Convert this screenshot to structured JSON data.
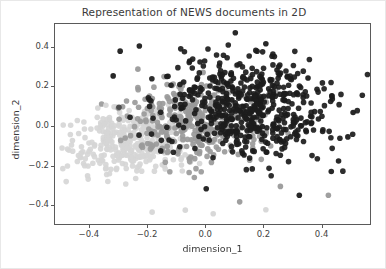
{
  "figure": {
    "width": 386,
    "height": 269,
    "background": "#ffffff",
    "frame_color": "#5a5a5a"
  },
  "chart_data": {
    "type": "scatter",
    "title": "Representation of NEWS documents in 2D",
    "xlabel": "dimension_1",
    "ylabel": "dimension_2",
    "xlim": [
      -0.52,
      0.57
    ],
    "ylim": [
      -0.5,
      0.52
    ],
    "xticks": [
      -0.4,
      -0.2,
      0.0,
      0.2,
      0.4
    ],
    "xticklabels": [
      "−0.4",
      "−0.2",
      "0.0",
      "0.2",
      "0.4"
    ],
    "yticks": [
      -0.4,
      -0.2,
      0.0,
      0.2,
      0.4
    ],
    "yticklabels": [
      "−0.4",
      "−0.2",
      "0.0",
      "0.2",
      "0.4"
    ],
    "grid": false,
    "legend": null,
    "marker": "circle",
    "marker_size_px": 5.6,
    "marker_alpha": 0.92,
    "series": [
      {
        "name": "cluster-light",
        "color": "#d6d6d6",
        "count": 360,
        "center": [
          -0.245,
          -0.072
        ],
        "spread": [
          0.115,
          0.082
        ],
        "rotation_deg": 14,
        "seed": 1377
      },
      {
        "name": "cluster-medium",
        "color": "#9a9a9a",
        "count": 330,
        "center": [
          -0.035,
          0.018
        ],
        "spread": [
          0.125,
          0.11
        ],
        "rotation_deg": 26,
        "seed": 4211
      },
      {
        "name": "cluster-dark",
        "color": "#1c1c1c",
        "count": 520,
        "center": [
          0.145,
          0.095
        ],
        "spread": [
          0.15,
          0.128
        ],
        "rotation_deg": -12,
        "seed": 8093
      }
    ],
    "outliers": [
      {
        "x": -0.296,
        "y": 0.383,
        "color": "#1c1c1c"
      },
      {
        "x": -0.23,
        "y": 0.409,
        "color": "#1c1c1c"
      },
      {
        "x": -0.32,
        "y": 0.258,
        "color": "#1c1c1c"
      },
      {
        "x": -0.3,
        "y": 0.1,
        "color": "#4a4a4a"
      },
      {
        "x": 0.1,
        "y": 0.476,
        "color": "#1c1c1c"
      },
      {
        "x": 0.205,
        "y": 0.42,
        "color": "#1c1c1c"
      },
      {
        "x": 0.35,
        "y": 0.247,
        "color": "#1c1c1c"
      },
      {
        "x": 0.432,
        "y": 0.158,
        "color": "#1c1c1c"
      },
      {
        "x": 0.505,
        "y": 0.073,
        "color": "#1c1c1c"
      },
      {
        "x": 0.487,
        "y": -0.05,
        "color": "#1c1c1c"
      },
      {
        "x": 0.455,
        "y": -0.172,
        "color": "#1c1c1c"
      },
      {
        "x": 0.43,
        "y": -0.225,
        "color": "#1c1c1c"
      },
      {
        "x": 0.42,
        "y": -0.345,
        "color": "#9a9a9a"
      },
      {
        "x": 0.32,
        "y": -0.345,
        "color": "#1c1c1c"
      },
      {
        "x": 0.0,
        "y": -0.312,
        "color": "#1c1c1c"
      },
      {
        "x": -0.46,
        "y": -0.068,
        "color": "#d6d6d6"
      },
      {
        "x": -0.43,
        "y": -0.132,
        "color": "#d6d6d6"
      },
      {
        "x": -0.408,
        "y": -0.246,
        "color": "#d6d6d6"
      },
      {
        "x": -0.186,
        "y": -0.43,
        "color": "#d6d6d6"
      },
      {
        "x": -0.072,
        "y": -0.42,
        "color": "#d6d6d6"
      },
      {
        "x": 0.024,
        "y": -0.438,
        "color": "#d6d6d6"
      },
      {
        "x": 0.205,
        "y": -0.418,
        "color": "#d6d6d6"
      },
      {
        "x": 0.115,
        "y": -0.378,
        "color": "#9a9a9a"
      },
      {
        "x": 0.255,
        "y": -0.3,
        "color": "#9a9a9a"
      },
      {
        "x": -0.235,
        "y": 0.292,
        "color": "#9a9a9a"
      },
      {
        "x": -0.345,
        "y": 0.11,
        "color": "#d6d6d6"
      }
    ]
  },
  "axes": {
    "title": "Representation of NEWS documents in 2D",
    "xlabel": "dimension_1",
    "ylabel": "dimension_2",
    "xtick_labels": [
      "−0.4",
      "−0.2",
      "0.0",
      "0.2",
      "0.4"
    ],
    "ytick_labels": [
      "0.4",
      "0.2",
      "0.0",
      "−0.2",
      "−0.4"
    ]
  }
}
